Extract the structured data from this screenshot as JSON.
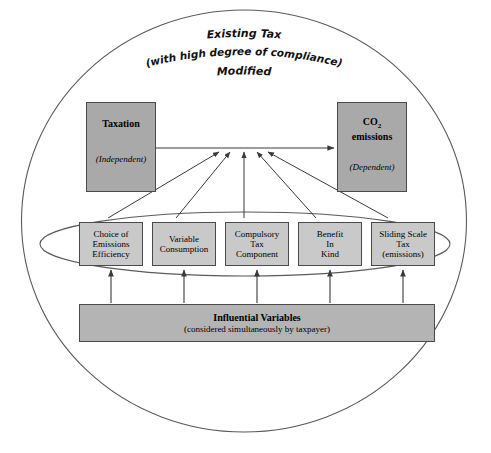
{
  "diagram": {
    "header": {
      "line1": "Existing Tax",
      "line2": "(with high degree of compliance)",
      "line3": "Modified"
    },
    "independent_node": {
      "title": "Taxation",
      "subtitle": "(Independent)",
      "fill": "#a9a9a9"
    },
    "dependent_node": {
      "title_prefix": "CO",
      "title_subscript": "2",
      "title_suffix": "emissions",
      "subtitle": "(Dependent)",
      "fill": "#a9a9a9"
    },
    "variables": [
      {
        "lines": [
          "Choice of",
          "Emissions",
          "Efficiency"
        ]
      },
      {
        "lines": [
          "Variable",
          "Consumption"
        ]
      },
      {
        "lines": [
          "Compulsory",
          "Tax",
          "Component"
        ]
      },
      {
        "lines": [
          "Benefit",
          "In",
          "Kind"
        ]
      },
      {
        "lines": [
          "Sliding Scale",
          "Tax",
          "(emissions)"
        ]
      }
    ],
    "variables_fill": "#c9c9c9",
    "influential_node": {
      "title": "Influential Variables",
      "subtitle": "(considered simultaneously by taxpayer)",
      "fill": "#b4b4b4"
    },
    "colors": {
      "stroke": "#4a4a4a",
      "background": "#ffffff",
      "text": "#000000"
    }
  }
}
